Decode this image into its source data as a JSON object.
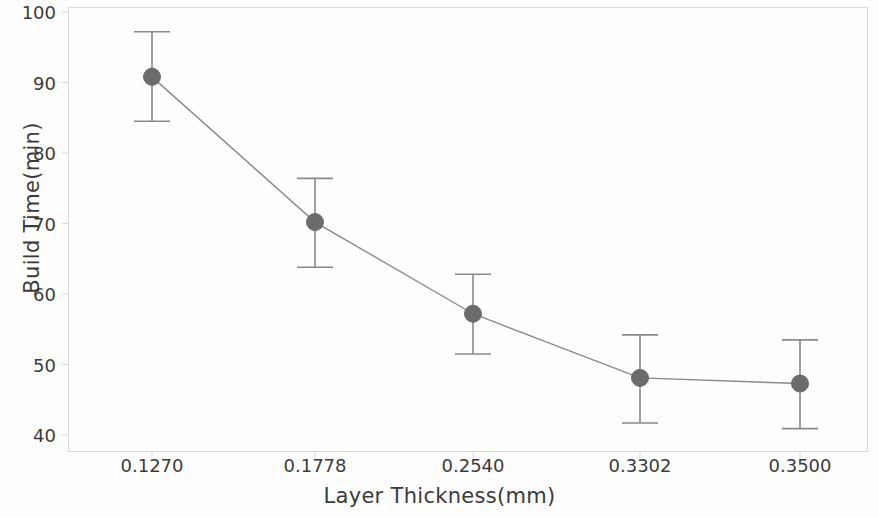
{
  "chart_data": {
    "type": "line",
    "title": "",
    "subtitle": "",
    "xlabel": "Layer Thickness(mm)",
    "ylabel": "Build Time(min)",
    "categories": [
      "0.1270",
      "0.1778",
      "0.2540",
      "0.3302",
      "0.3500"
    ],
    "x_values": [
      0.127,
      0.1778,
      0.254,
      0.3302,
      0.35
    ],
    "values": [
      90.8,
      70.2,
      57.2,
      48.1,
      47.3
    ],
    "error_upper": [
      97.2,
      76.4,
      62.8,
      54.2,
      53.5
    ],
    "error_lower": [
      84.5,
      63.8,
      51.5,
      41.7,
      40.9
    ],
    "error_bars": true,
    "ylim": [
      36.5,
      101.5
    ],
    "y_ticks": [
      100,
      90,
      80,
      70,
      60,
      50,
      40
    ],
    "y_tick_labels": [
      "100",
      "90",
      "80",
      "70",
      "60",
      "50",
      "40"
    ],
    "x_tick_labels": [
      "0.1270",
      "0.1778",
      "0.2540",
      "0.3302",
      "0.3500"
    ],
    "grid": false,
    "legend": "none",
    "series": [
      {
        "name": "Build Time",
        "values": [
          90.8,
          70.2,
          57.2,
          48.1,
          47.3
        ],
        "marker": "circle",
        "marker_color": "#6b6b6b",
        "line_color": "#808080"
      }
    ],
    "colors": {
      "marker": "#6b6b6b",
      "line": "#8a8a8a",
      "error_bar": "#8a8a8a",
      "axis": "#d9d9d9",
      "text": "#3b3b3b",
      "background": "#fefefe"
    }
  },
  "axes": {
    "y_label": "Build Time(min)",
    "x_label": "Layer Thickness(mm)"
  }
}
